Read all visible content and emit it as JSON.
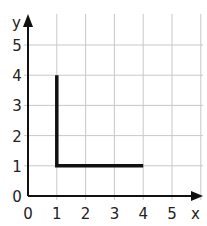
{
  "chart_data": {
    "type": "line",
    "title": "",
    "xlabel": "x",
    "ylabel": "y",
    "xlim": [
      0,
      5.9
    ],
    "ylim": [
      0,
      6
    ],
    "grid": true,
    "x_ticks": [
      "0",
      "1",
      "2",
      "3",
      "4",
      "5"
    ],
    "y_ticks": [
      "0",
      "1",
      "2",
      "3",
      "4",
      "5"
    ],
    "series": [
      {
        "name": "L-shape",
        "points": [
          [
            1,
            4
          ],
          [
            1,
            1
          ],
          [
            4,
            1
          ]
        ]
      }
    ],
    "colors": {
      "grid": "#c8c8c8",
      "axis": "#111111",
      "line": "#111111"
    }
  }
}
